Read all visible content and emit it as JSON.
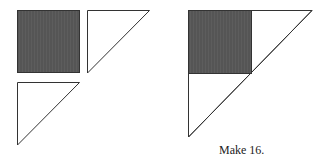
{
  "diagram": {
    "colors": {
      "dark_fill": "#555555",
      "light_fill": "#ffffff",
      "stroke": "#333333"
    },
    "pieces": {
      "square": {
        "label": "dark square",
        "x": 17,
        "y": 10,
        "size": 62
      },
      "triangle_top": {
        "label": "light triangle",
        "points": "87,10 149,10 87,73"
      },
      "triangle_bottom": {
        "label": "light triangle",
        "points": "17,82 79,82 17,145"
      }
    },
    "assembled": {
      "big_triangle": {
        "points": "188,10 312,10 188,137"
      },
      "square": {
        "x": 188,
        "y": 10,
        "size": 63
      }
    },
    "caption": "Make 16."
  }
}
